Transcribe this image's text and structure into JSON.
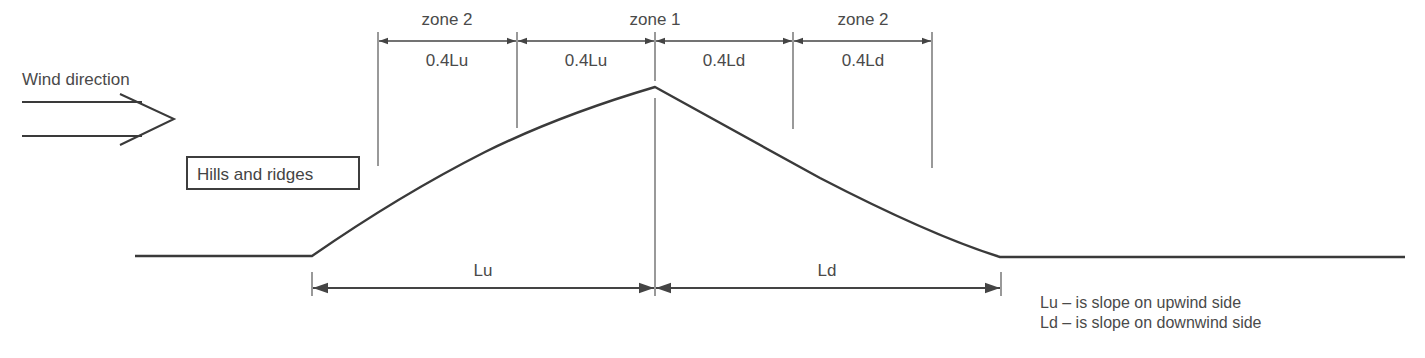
{
  "diagram": {
    "title_label": "Wind direction",
    "boxed_label": "Hills and ridges",
    "zones": {
      "left": "zone 2",
      "center": "zone 1",
      "right": "zone 2"
    },
    "segments": [
      "0.4Lu",
      "0.4Lu",
      "0.4Ld",
      "0.4Ld"
    ],
    "slopes": {
      "upwind": "Lu",
      "downwind": "Ld"
    },
    "legend": [
      "Lu – is slope on upwind side",
      "Ld – is slope on downwind side"
    ],
    "colors": {
      "line": "#3a3a3a",
      "thin_line": "#555555",
      "text": "#4a4a4a"
    }
  }
}
